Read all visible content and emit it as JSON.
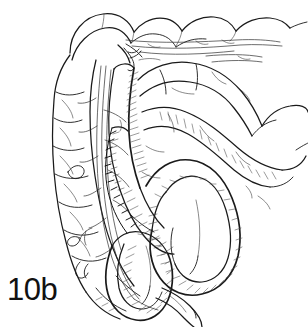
{
  "figure": {
    "label": "10b",
    "caption_text": "10b",
    "style": "pen-and-ink line art with hatched shading",
    "background_color": "#ffffff",
    "ink_color": "#1a1a1a",
    "shading_color": "#4a4a4a",
    "parts": [
      {
        "name": "transverse-colon",
        "label": "transverse colon"
      },
      {
        "name": "ascending-colon",
        "label": "ascending colon"
      },
      {
        "name": "descending-colon",
        "label": "descending colon"
      },
      {
        "name": "cecum",
        "label": "cecum"
      },
      {
        "name": "appendix",
        "label": "appendix"
      },
      {
        "name": "small-bowel-loops",
        "label": "small bowel loops"
      },
      {
        "name": "anastomosis-suture",
        "label": "anastomosis suture line"
      },
      {
        "name": "mesenteric-vessels",
        "label": "mesenteric vessels"
      }
    ]
  }
}
